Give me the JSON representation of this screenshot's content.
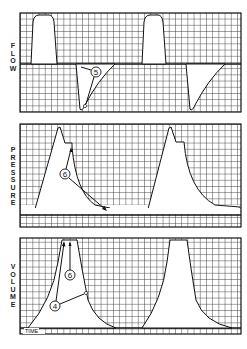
{
  "figure": {
    "panels": [
      {
        "id": "flow",
        "label": "FLOW",
        "letters": [
          "F",
          "L",
          "O",
          "W"
        ]
      },
      {
        "id": "pressure",
        "label": "PRESSURE",
        "letters": [
          "P",
          "R",
          "E",
          "S",
          "S",
          "U",
          "R",
          "E"
        ]
      },
      {
        "id": "volume",
        "label": "VOLUME",
        "letters": [
          "V",
          "O",
          "L",
          "U",
          "M",
          "E"
        ]
      }
    ],
    "time_label": "TIME",
    "annotations": [
      {
        "panel": "flow",
        "marker": "5"
      },
      {
        "panel": "pressure",
        "marker": "6"
      },
      {
        "panel": "volume",
        "marker": "6"
      },
      {
        "panel": "volume",
        "marker": "4"
      }
    ],
    "colors": {
      "grid": "#3a3a3a",
      "background": "#ffffff",
      "waveform_fill": "#ffffff",
      "line": "#111111"
    }
  }
}
